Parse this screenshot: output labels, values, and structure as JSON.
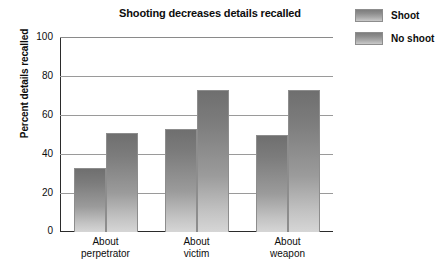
{
  "chart_data": {
    "type": "bar",
    "title": "Shooting decreases details recalled",
    "xlabel": "",
    "ylabel": "Percent details recalled",
    "categories": [
      "About perpetrator",
      "About victim",
      "About weapon"
    ],
    "category_lines": [
      [
        "About",
        "perpetrator"
      ],
      [
        "About",
        "victim"
      ],
      [
        "About",
        "weapon"
      ]
    ],
    "series": [
      {
        "name": "Shoot",
        "values": [
          33,
          53,
          50
        ]
      },
      {
        "name": "No shoot",
        "values": [
          51,
          73,
          73
        ]
      }
    ],
    "ylim": [
      0,
      100
    ],
    "yticks": [
      100,
      80,
      60,
      40,
      20,
      0
    ],
    "grid": true,
    "legend_position": "top-right",
    "bar_color_top": "#6f6f6f",
    "bar_color_bottom": "#d6d6d6",
    "axis_color": "#2b2b2b",
    "gridline_color": "#9a9a9a"
  },
  "legend": {
    "items": [
      {
        "label": "Shoot"
      },
      {
        "label": "No shoot"
      }
    ]
  }
}
